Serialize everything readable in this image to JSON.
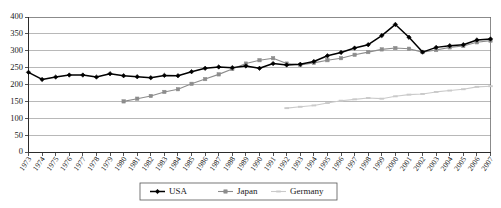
{
  "chart_data": {
    "type": "line",
    "title": "",
    "xlabel": "",
    "ylabel": "",
    "ylim": [
      0,
      400
    ],
    "ytick_step": 50,
    "yticks": [
      0,
      50,
      100,
      150,
      200,
      250,
      300,
      350,
      400
    ],
    "grid": true,
    "legend_position": "bottom-center",
    "x": [
      1973,
      1974,
      1975,
      1976,
      1977,
      1978,
      1979,
      1980,
      1981,
      1982,
      1983,
      1984,
      1985,
      1986,
      1987,
      1988,
      1989,
      1990,
      1991,
      1992,
      1993,
      1994,
      1995,
      1996,
      1997,
      1998,
      1999,
      2000,
      2001,
      2002,
      2003,
      2004,
      2005,
      2006,
      2007
    ],
    "categories": [
      "1973",
      "1974",
      "1975",
      "1976",
      "1977",
      "1978",
      "1979",
      "1980",
      "1981",
      "1982",
      "1983",
      "1984",
      "1985",
      "1986",
      "1987",
      "1988",
      "1989",
      "1990",
      "1991",
      "1992",
      "1993",
      "1994",
      "1995",
      "1996",
      "1997",
      "1998",
      "1999",
      "2000",
      "2001",
      "2002",
      "2003",
      "2004",
      "2005",
      "2006",
      "2007"
    ],
    "series": [
      {
        "name": "USA",
        "color": "#000000",
        "marker": "diamond",
        "values": [
          236,
          215,
          222,
          228,
          228,
          222,
          232,
          226,
          223,
          220,
          227,
          226,
          238,
          248,
          252,
          250,
          255,
          248,
          262,
          258,
          260,
          268,
          285,
          295,
          308,
          318,
          345,
          378,
          340,
          296,
          310,
          315,
          318,
          332,
          335
        ]
      },
      {
        "name": "Japan",
        "color": "#8c8c8c",
        "marker": "square",
        "values": [
          null,
          null,
          null,
          null,
          null,
          null,
          null,
          150,
          158,
          166,
          178,
          186,
          202,
          216,
          230,
          246,
          262,
          272,
          278,
          262,
          258,
          264,
          272,
          278,
          288,
          296,
          304,
          308,
          306,
          296,
          302,
          310,
          314,
          325,
          330
        ]
      },
      {
        "name": "Germany",
        "color": "#cacaca",
        "marker": "dash",
        "values": [
          null,
          null,
          null,
          null,
          null,
          null,
          null,
          null,
          null,
          null,
          null,
          null,
          null,
          null,
          null,
          null,
          null,
          null,
          null,
          130,
          134,
          138,
          145,
          152,
          156,
          160,
          158,
          165,
          170,
          172,
          178,
          182,
          186,
          193,
          195
        ]
      }
    ]
  },
  "legend": {
    "items": [
      {
        "label": "USA"
      },
      {
        "label": "Japan"
      },
      {
        "label": "Germany"
      }
    ]
  }
}
